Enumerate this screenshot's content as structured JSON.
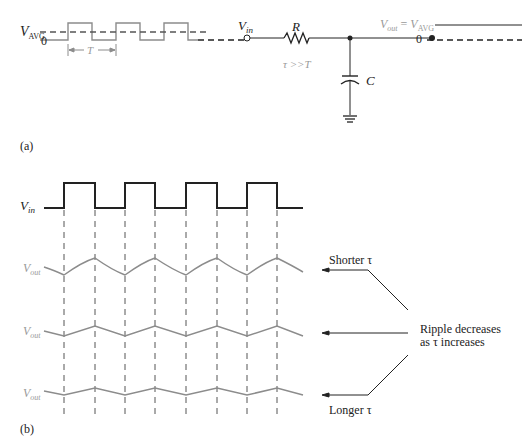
{
  "figure_a": {
    "panel_label": "(a)",
    "input_wave": {
      "v_avg_label": "V",
      "v_avg_sub": "AVG",
      "zero_label": "0",
      "period_label": "T"
    },
    "circuit": {
      "vin_label": "V",
      "vin_sub": "in",
      "resistor_label": "R",
      "capacitor_label": "C",
      "condition": "τ >>T"
    },
    "output": {
      "vout_label": "V",
      "vout_sub": "out",
      "equals": " = ",
      "vavg_label": "V",
      "vavg_sub": "AVG",
      "zero_label": "0"
    }
  },
  "figure_b": {
    "panel_label": "(b)",
    "vin_label": "V",
    "vin_sub": "in",
    "traces": [
      {
        "label": "V",
        "sub": "out",
        "ripple": "large"
      },
      {
        "label": "V",
        "sub": "out",
        "ripple": "medium"
      },
      {
        "label": "V",
        "sub": "out",
        "ripple": "small"
      }
    ],
    "annotations": {
      "shorter": "Shorter τ",
      "longer": "Longer τ",
      "ripple_line1": "Ripple decreases",
      "ripple_line2": "as τ increases"
    }
  },
  "colors": {
    "ink": "#222222",
    "gray": "#8c8c8c",
    "dash": "#555555"
  }
}
